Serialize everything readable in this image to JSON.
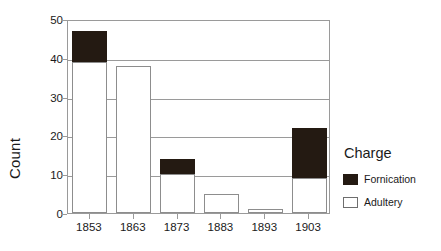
{
  "chart_data": {
    "type": "bar",
    "subtype": "stacked-bar",
    "title": "",
    "xlabel": "",
    "ylabel": "Count",
    "categories": [
      "1853",
      "1863",
      "1873",
      "1883",
      "1893",
      "1903"
    ],
    "series": [
      {
        "name": "Adultery",
        "color": "#ffffff",
        "values": [
          39,
          38,
          10,
          5,
          1,
          9
        ]
      },
      {
        "name": "Fornication",
        "color": "#241a12",
        "values": [
          8,
          0,
          4,
          0,
          0,
          13
        ]
      }
    ],
    "totals": [
      47,
      38,
      14,
      5,
      1,
      22
    ],
    "ylim": [
      0,
      50
    ],
    "yticks": [
      0,
      10,
      20,
      30,
      40,
      50
    ],
    "ytick_labels": [
      "0",
      "10",
      "20",
      "30",
      "40",
      "50"
    ],
    "grid": true,
    "grid_axis": "y",
    "legend": {
      "title": "Charge",
      "position": "right",
      "entries": [
        {
          "label": "Fornication",
          "swatch": "fill-dark"
        },
        {
          "label": "Adultery",
          "swatch": "fill-light"
        }
      ]
    }
  }
}
